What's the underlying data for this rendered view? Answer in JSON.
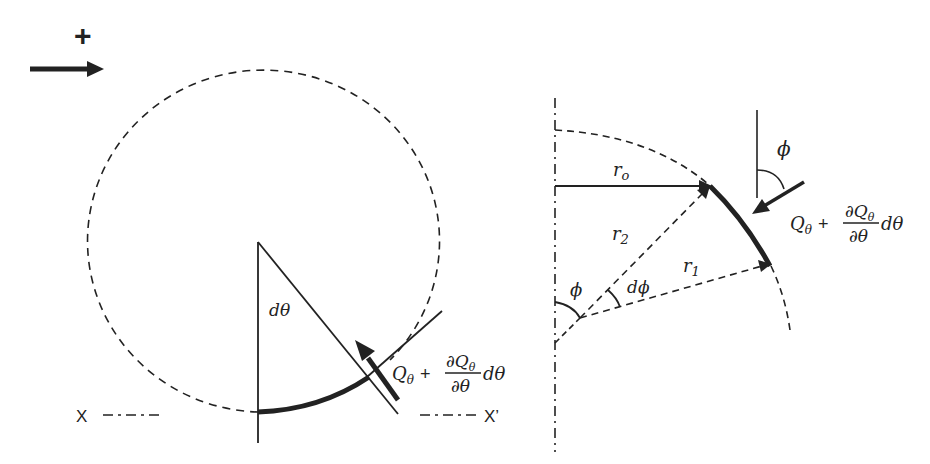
{
  "diagram": {
    "left_figure": {
      "sign_convention": {
        "symbol": "+",
        "arrow_direction": "right"
      },
      "angle_label": "dθ",
      "force_label": {
        "term1": "Q",
        "term1_sub": "θ",
        "plus": "+",
        "numerator": "∂Q",
        "numerator_sub": "θ",
        "denominator": "∂θ",
        "suffix": "dθ"
      },
      "axis_left_label": "X",
      "axis_right_label": "X’"
    },
    "right_figure": {
      "radius_labels": {
        "r_o": {
          "base": "r",
          "sub": "o"
        },
        "r_2": {
          "base": "r",
          "sub": "2"
        },
        "r_1": {
          "base": "r",
          "sub": "1"
        }
      },
      "angle_phi_axis": "ϕ",
      "angle_dphi": "dϕ",
      "angle_phi_force": "ϕ",
      "force_label": {
        "term1": "Q",
        "term1_sub": "θ",
        "plus": "+",
        "numerator": "∂Q",
        "numerator_sub": "θ",
        "denominator": "∂θ",
        "suffix": "dθ"
      }
    },
    "colors": {
      "stroke": "#222222",
      "background": "#ffffff"
    }
  }
}
